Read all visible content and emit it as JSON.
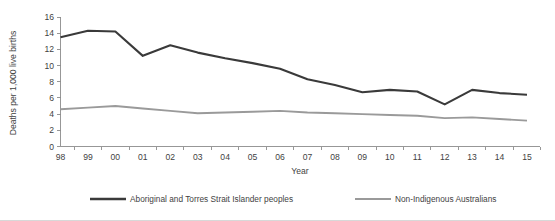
{
  "chart_data": {
    "type": "line",
    "title": "",
    "xlabel": "Year",
    "ylabel": "Deaths per 1,000 live births",
    "categories": [
      "98",
      "99",
      "00",
      "01",
      "02",
      "03",
      "04",
      "05",
      "06",
      "07",
      "08",
      "09",
      "10",
      "11",
      "12",
      "13",
      "14",
      "15"
    ],
    "x": [
      1998,
      1999,
      2000,
      2001,
      2002,
      2003,
      2004,
      2005,
      2006,
      2007,
      2008,
      2009,
      2010,
      2011,
      2012,
      2013,
      2014,
      2015
    ],
    "xlim": [
      1998,
      2015
    ],
    "ylim": [
      0,
      16
    ],
    "yticks": [
      0,
      2,
      4,
      6,
      8,
      10,
      12,
      14,
      16
    ],
    "grid": false,
    "legend_position": "bottom",
    "series": [
      {
        "name": "Aboriginal and Torres Strait Islander peoples",
        "color": "#3a3a3a",
        "values": [
          13.5,
          14.3,
          14.2,
          11.2,
          12.5,
          11.6,
          10.9,
          10.3,
          9.6,
          8.3,
          7.6,
          6.7,
          7.0,
          6.8,
          5.2,
          7.0,
          6.6,
          6.4
        ]
      },
      {
        "name": "Non-Indigenous Australians",
        "color": "#9a9a9a",
        "values": [
          4.6,
          4.8,
          5.0,
          4.7,
          4.4,
          4.1,
          4.2,
          4.3,
          4.4,
          4.2,
          4.1,
          4.0,
          3.9,
          3.8,
          3.5,
          3.6,
          3.4,
          3.2
        ]
      }
    ]
  },
  "legend": {
    "items": [
      {
        "label": "Aboriginal and Torres Strait Islander peoples",
        "color": "#3a3a3a"
      },
      {
        "label": "Non-Indigenous Australians",
        "color": "#9a9a9a"
      }
    ]
  },
  "axes": {
    "y_title": "Deaths per 1,000 live births",
    "x_title": "Year"
  }
}
